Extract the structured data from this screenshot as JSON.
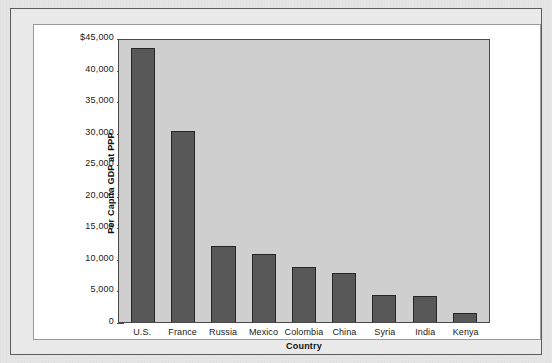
{
  "figure": {
    "frame_color": "#5c5c5c",
    "page_background": "#e6e6e6",
    "plate_background": "#ffffff"
  },
  "chart_data": {
    "type": "bar",
    "title": "",
    "xlabel": "Country",
    "ylabel": "Per Capita GDP at PPP",
    "categories": [
      "U.S.",
      "France",
      "Russia",
      "Mexico",
      "Colombia",
      "China",
      "Syria",
      "India",
      "Kenya"
    ],
    "values": [
      43400,
      30200,
      12100,
      10800,
      8700,
      7800,
      4300,
      4100,
      1400
    ],
    "ylim": [
      0,
      45000
    ],
    "ytick_values": [
      0,
      5000,
      10000,
      15000,
      20000,
      25000,
      30000,
      35000,
      40000,
      45000
    ],
    "ytick_labels": [
      "0",
      "5,000",
      "10,000",
      "15,000",
      "20,000",
      "25,000",
      "30,000",
      "35,000",
      "40,000",
      "$45,000"
    ],
    "grid": false,
    "legend": false,
    "bar_color": "#585858",
    "bar_edge_color": "#262626",
    "plot_background": "#cfcfcf",
    "axis_color": "#4a4a4a"
  }
}
